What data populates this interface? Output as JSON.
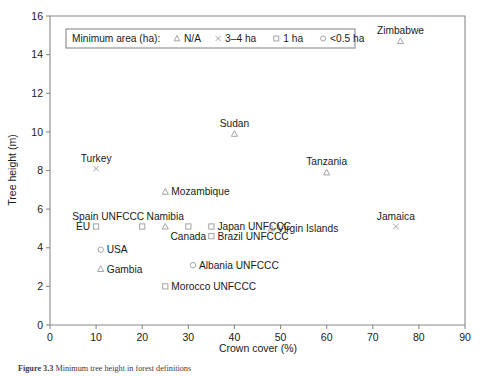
{
  "chart_data": {
    "type": "scatter",
    "title": "",
    "xlabel": "Crown cover (%)",
    "ylabel": "Tree height (m)",
    "xlim": [
      0,
      90
    ],
    "ylim": [
      0,
      16
    ],
    "xticks": [
      0,
      10,
      20,
      30,
      40,
      50,
      60,
      70,
      80,
      90
    ],
    "yticks": [
      0,
      2,
      4,
      6,
      8,
      10,
      12,
      14,
      16
    ],
    "grid": false,
    "legend": {
      "position": "top-left-inside",
      "title": "Minimum area (ha):",
      "entries": [
        {
          "marker": "triangle",
          "label": "N/A"
        },
        {
          "marker": "cross",
          "label": "3–4 ha"
        },
        {
          "marker": "square",
          "label": "1 ha"
        },
        {
          "marker": "circle",
          "label": "<0.5 ha"
        }
      ]
    },
    "points": [
      {
        "name": "Zimbabwe",
        "x": 76,
        "y": 14.7,
        "marker": "triangle",
        "label_pos": "above"
      },
      {
        "name": "Sudan",
        "x": 40,
        "y": 9.9,
        "marker": "triangle",
        "label_pos": "above"
      },
      {
        "name": "Tanzania",
        "x": 60,
        "y": 7.9,
        "marker": "triangle",
        "label_pos": "above"
      },
      {
        "name": "Turkey",
        "x": 10,
        "y": 8.1,
        "marker": "cross",
        "label_pos": "above"
      },
      {
        "name": "Mozambique",
        "x": 25,
        "y": 6.9,
        "marker": "triangle",
        "label_pos": "right"
      },
      {
        "name": "Spain UNFCCC",
        "x": 20,
        "y": 5.1,
        "marker": "square",
        "label_pos": "above-left"
      },
      {
        "name": "Namibia",
        "x": 25,
        "y": 5.1,
        "marker": "triangle",
        "label_pos": "above"
      },
      {
        "name": "EU",
        "x": 10,
        "y": 5.1,
        "marker": "square",
        "label_pos": "left"
      },
      {
        "name": "Canada",
        "x": 30,
        "y": 5.1,
        "marker": "square",
        "label_pos": "below"
      },
      {
        "name": "Japan UNFCCC",
        "x": 35,
        "y": 5.1,
        "marker": "square",
        "label_pos": "right"
      },
      {
        "name": "Brazil UNFCCC",
        "x": 35,
        "y": 4.6,
        "marker": "square",
        "label_pos": "right"
      },
      {
        "name": "Virgin Islands",
        "x": 48,
        "y": 5.0,
        "marker": "triangle",
        "label_pos": "right"
      },
      {
        "name": "Jamaica",
        "x": 75,
        "y": 5.1,
        "marker": "cross",
        "label_pos": "above"
      },
      {
        "name": "USA",
        "x": 11,
        "y": 3.9,
        "marker": "circle",
        "label_pos": "right"
      },
      {
        "name": "Albania UNFCCC",
        "x": 31,
        "y": 3.1,
        "marker": "circle",
        "label_pos": "right"
      },
      {
        "name": "Gambia",
        "x": 11,
        "y": 2.9,
        "marker": "triangle",
        "label_pos": "right"
      },
      {
        "name": "Morocco UNFCCC",
        "x": 25,
        "y": 2.0,
        "marker": "square",
        "label_pos": "right"
      }
    ]
  },
  "caption": {
    "figure_number": "Figure 3.3",
    "text": "Minimum tree height in forest definitions"
  }
}
